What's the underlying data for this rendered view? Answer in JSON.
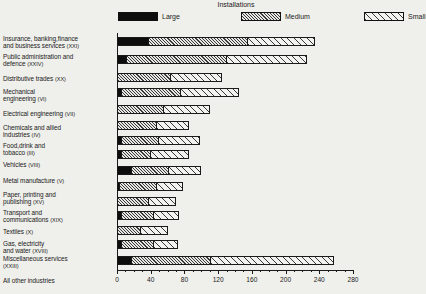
{
  "chart": {
    "title": "Installations",
    "legend": [
      {
        "label": "Large",
        "fill": "fill-large"
      },
      {
        "label": "Medium",
        "fill": "fill-medium"
      },
      {
        "label": "Small",
        "fill": "fill-small"
      }
    ]
  },
  "chart_data": {
    "type": "bar",
    "orientation": "horizontal",
    "stacked": true,
    "title": "Installations",
    "xlabel": "",
    "ylabel": "",
    "xlim": [
      0,
      280
    ],
    "xticks": [
      0,
      40,
      80,
      120,
      160,
      200,
      240,
      280
    ],
    "grid": false,
    "legend_position": "top",
    "categories": [
      "Insurance, banking,finance and business services (XXI)",
      "Public administration and defence (XXIV)",
      "Distributive trades (XX)",
      "Mechanical engineering (VI)",
      "Electrical engineering (VII)",
      "Chemicals and allied industries (IV)",
      "Food,drink and tobacco (III)",
      "Vehicles (VIII)",
      "Metal manufacture (V)",
      "Paper, printing and publishing (XV)",
      "Transport and communications (XIX)",
      "Textiles (X)",
      "Gas, electricity and water (XVIII)",
      "Miscellaneous services (XXIII)",
      "All other industries"
    ],
    "series": [
      {
        "name": "Large",
        "values": [
          38,
          12,
          0,
          6,
          0,
          0,
          6,
          6,
          18,
          4,
          0,
          6,
          0,
          6,
          18
        ]
      },
      {
        "name": "Medium",
        "values": [
          117,
          118,
          64,
          70,
          56,
          48,
          44,
          34,
          44,
          44,
          38,
          38,
          28,
          38,
          94
        ]
      },
      {
        "name": "Small",
        "values": [
          80,
          95,
          60,
          69,
          54,
          38,
          48,
          45,
          38,
          30,
          32,
          30,
          32,
          28,
          146
        ]
      }
    ],
    "totals": [
      235,
      225,
      124,
      145,
      110,
      86,
      98,
      85,
      100,
      78,
      70,
      74,
      60,
      72,
      258
    ]
  },
  "labels": [
    {
      "lines": [
        "Insurance, banking,finance",
        "and business services (XXI)"
      ],
      "top": 35
    },
    {
      "lines": [
        "Public administration and",
        "defence (XXIV)"
      ],
      "top": 53
    },
    {
      "lines": [
        "Distributive trades (XX)"
      ],
      "top": 75
    },
    {
      "lines": [
        "Mechanical",
        "engineering (VI)"
      ],
      "top": 88
    },
    {
      "lines": [
        "Electrical engineering (VII)"
      ],
      "top": 110
    },
    {
      "lines": [
        "Chemicals and allied",
        "industries (IV)"
      ],
      "top": 124
    },
    {
      "lines": [
        "Food,drink and",
        "tobacco (III)"
      ],
      "top": 142
    },
    {
      "lines": [
        "Vehicles (VIII)"
      ],
      "top": 161
    },
    {
      "lines": [
        "Metal manufacture (V)"
      ],
      "top": 177
    },
    {
      "lines": [
        "Paper, printing and",
        "publishing (XV)"
      ],
      "top": 191
    },
    {
      "lines": [
        "Transport and",
        "communications (XIX)"
      ],
      "top": 209
    },
    {
      "lines": [
        "Textiles (X)"
      ],
      "top": 228
    },
    {
      "lines": [
        "Gas, electricity",
        "and water (XVIII)"
      ],
      "top": 240
    },
    {
      "lines": [
        "Miscellaneous services",
        "(XXIII)"
      ],
      "top": 255
    },
    {
      "lines": [
        "All other industries"
      ],
      "top": 277
    }
  ],
  "rows_top": [
    37,
    55,
    73,
    88,
    105,
    121,
    136,
    150,
    166,
    182,
    197,
    211,
    226,
    240,
    256
  ]
}
